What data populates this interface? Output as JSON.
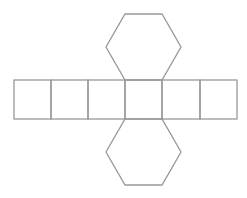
{
  "diagram": {
    "stroke_color": "#999999",
    "background": "#ffffff",
    "faces": {
      "rectangles": [
        {
          "x": 14,
          "y": 80,
          "w": 37,
          "h": 39
        },
        {
          "x": 51,
          "y": 80,
          "w": 37,
          "h": 39
        },
        {
          "x": 88,
          "y": 80,
          "w": 37,
          "h": 39
        },
        {
          "x": 125,
          "y": 80,
          "w": 37,
          "h": 39
        },
        {
          "x": 162,
          "y": 80,
          "w": 38,
          "h": 39
        },
        {
          "x": 200,
          "y": 80,
          "w": 37,
          "h": 39
        }
      ],
      "hexagons": [
        {
          "name": "top-hexagon",
          "points": "125,14 162,14 181,47 162,80 125,80 106,47"
        },
        {
          "name": "bottom-hexagon",
          "points": "125,119 162,119 181,152 162,185 125,185 106,152"
        }
      ]
    }
  }
}
